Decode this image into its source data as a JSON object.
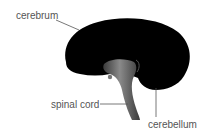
{
  "diagram": {
    "labels": {
      "cerebrum": "cerebrum",
      "spinal_cord": "spinal cord",
      "cerebellum": "cerebellum"
    },
    "colors": {
      "brain": "#000000",
      "brainstem": "#6a6a6a",
      "leader_line": "#555555",
      "text": "#555555",
      "background": "#ffffff"
    }
  }
}
